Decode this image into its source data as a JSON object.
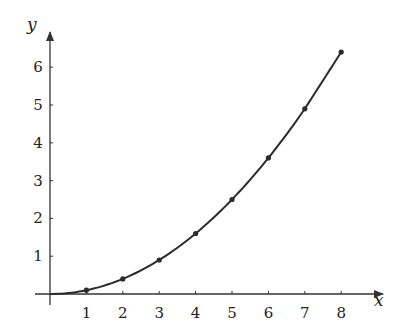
{
  "chart_data": {
    "type": "line",
    "title": "",
    "xlabel": "x",
    "ylabel": "y",
    "x": [
      1,
      2,
      3,
      4,
      5,
      6,
      7,
      8
    ],
    "series": [
      {
        "name": "y = x^2/10",
        "values": [
          0.1,
          0.4,
          0.9,
          1.6,
          2.5,
          3.6,
          4.9,
          6.4
        ],
        "markers": true,
        "smooth_curve_from_origin": true
      }
    ],
    "xticks": [
      "1",
      "2",
      "3",
      "4",
      "5",
      "6",
      "7",
      "8"
    ],
    "yticks": [
      "1",
      "2",
      "3",
      "4",
      "5",
      "6"
    ],
    "xlim": [
      0,
      8.9
    ],
    "ylim": [
      0,
      7
    ],
    "grid": false,
    "legend": "none",
    "axes_style": "arrowed axes through origin"
  },
  "colors": {
    "line": "#2b2b2b",
    "axis": "#333333",
    "text": "#222222",
    "background": "#ffffff"
  }
}
